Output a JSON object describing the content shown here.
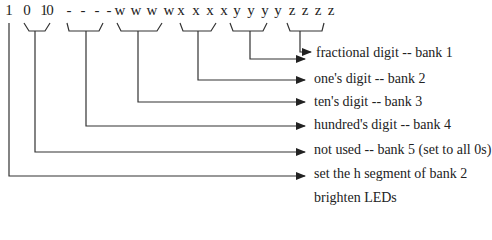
{
  "bits": [
    "1",
    "0",
    "1",
    "0",
    "-",
    "-",
    "-",
    "-",
    "w",
    "w",
    "w",
    "w",
    "x",
    "x",
    "x",
    "x",
    "y",
    "y",
    "y",
    "y",
    "z",
    "z",
    "z",
    "z"
  ],
  "labels": [
    "fractional digit -- bank 1",
    "one's digit -- bank 2",
    "ten's digit -- bank 3",
    "hundred's digit -- bank 4",
    "not used -- bank 5 (set to all 0s)",
    "set the h segment of bank 2",
    "brighten LEDs"
  ],
  "caption": "Figure 14-14 ..."
}
